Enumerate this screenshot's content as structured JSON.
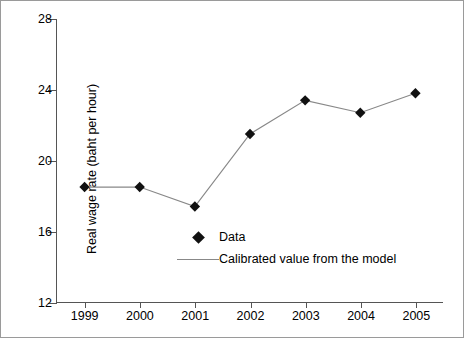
{
  "chart_data": {
    "type": "line",
    "title": "",
    "xlabel": "",
    "ylabel": "Real wage rate (baht per hour)",
    "categories": [
      "1999",
      "2000",
      "2001",
      "2002",
      "2003",
      "2004",
      "2005"
    ],
    "x": [
      1999,
      2000,
      2001,
      2002,
      2003,
      2004,
      2005
    ],
    "values": [
      18.5,
      18.5,
      17.4,
      21.5,
      23.4,
      22.7,
      23.8
    ],
    "series": [
      {
        "name": "Data",
        "marker": "diamond",
        "values": [
          18.5,
          18.5,
          17.4,
          21.5,
          23.4,
          22.7,
          23.8
        ]
      },
      {
        "name": "Calibrated value from the model",
        "marker": "line",
        "values": [
          18.5,
          18.5,
          17.4,
          21.5,
          23.4,
          22.7,
          23.8
        ]
      }
    ],
    "ylim": [
      12,
      28
    ],
    "yticks": [
      12,
      16,
      20,
      24,
      28
    ],
    "ytick_labels": [
      "12",
      "16",
      "20",
      "24",
      "28"
    ],
    "xtick_labels": [
      "1999",
      "2000",
      "2001",
      "2002",
      "2003",
      "2004",
      "2005"
    ],
    "grid": false,
    "legend_position": "inside-lower-center",
    "colors": {
      "marker": "#111111",
      "line": "#888888",
      "axis": "#555555",
      "frame": "#9a9a9a",
      "background": "#ffffff"
    }
  },
  "axes": {
    "y_title": "Real wage rate (baht per hour)",
    "y_ticks": [
      {
        "label": "28",
        "value": 28
      },
      {
        "label": "24",
        "value": 24
      },
      {
        "label": "20",
        "value": 20
      },
      {
        "label": "16",
        "value": 16
      },
      {
        "label": "12",
        "value": 12
      }
    ],
    "x_ticks": [
      {
        "label": "1999"
      },
      {
        "label": "2000"
      },
      {
        "label": "2001"
      },
      {
        "label": "2002"
      },
      {
        "label": "2003"
      },
      {
        "label": "2004"
      },
      {
        "label": "2005"
      }
    ]
  },
  "legend": {
    "items": [
      {
        "label": "Data",
        "key": "diamond-marker"
      },
      {
        "label": "Calibrated value from the model",
        "key": "line-swatch"
      }
    ]
  }
}
